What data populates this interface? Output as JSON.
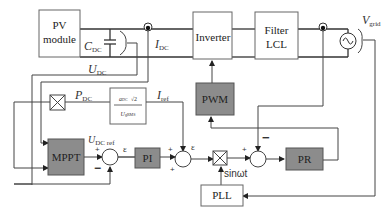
{
  "blocks": {
    "pv_module": {
      "line1": "PV",
      "line2": "module"
    },
    "inverter": "Inverter",
    "filter": {
      "line1": "Filter",
      "line2": "LCL"
    },
    "pwm": "PWM",
    "mppt": "MPPT",
    "pi": "PI",
    "pr": "PR",
    "pll": "PLL",
    "fraction": {
      "numerator_a": "a",
      "numerator_a_sub": "DC",
      "numerator_b": "√2",
      "denominator": "U",
      "denominator_sub": "gRMS"
    }
  },
  "labels": {
    "c_dc": {
      "main": "C",
      "sub": "DC"
    },
    "i_dc": {
      "main": "I",
      "sub": "DC"
    },
    "u_dc": {
      "main": "U",
      "sub": "DC"
    },
    "p_dc": {
      "main": "P",
      "sub": "DC"
    },
    "i_ref": {
      "main": "I",
      "sub": "ref"
    },
    "u_dc_ref": {
      "main": "U",
      "sub": "DC ref"
    },
    "v_grid": {
      "main": "V",
      "sub": "grid"
    },
    "sinwt": "sinωt",
    "epsilon1": "ε",
    "epsilon2": "ε"
  },
  "signs": {
    "sum1_plus": "+",
    "sum1_minus": "−",
    "sum2_plus_left": "+",
    "sum2_plus_bottom": "+",
    "sum3_plus": "+",
    "sum3_minus": "−"
  },
  "colors": {
    "gray_block": "#8c8c8c",
    "line": "#333333",
    "background": "#ffffff"
  }
}
